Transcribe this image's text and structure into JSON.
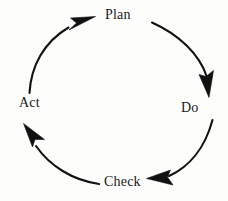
{
  "diagram": {
    "type": "cycle",
    "direction": "clockwise",
    "background_color": "#fdfdfc",
    "stroke_color": "#111111",
    "text_color": "#1a1a1a",
    "center": {
      "x": 114,
      "y": 100
    },
    "radius": 88,
    "nodes": [
      {
        "id": "plan",
        "label": "Plan",
        "position": "top",
        "x": 120,
        "y": 14,
        "angle_deg": 270
      },
      {
        "id": "do",
        "label": "Do",
        "position": "right",
        "x": 191,
        "y": 107,
        "angle_deg": 0
      },
      {
        "id": "check",
        "label": "Check",
        "position": "bottom",
        "x": 122,
        "y": 181,
        "angle_deg": 90
      },
      {
        "id": "act",
        "label": "Act",
        "position": "left",
        "x": 32,
        "y": 102,
        "angle_deg": 180
      }
    ],
    "arrows": [
      {
        "id": "arrow-plan-to-do",
        "from": "plan",
        "to": "do",
        "points_to": "Do",
        "arrowhead": "down"
      },
      {
        "id": "arrow-do-to-check",
        "from": "do",
        "to": "check",
        "points_to": "Check",
        "arrowhead": "left"
      },
      {
        "id": "arrow-check-to-act",
        "from": "check",
        "to": "act",
        "points_to": "Act",
        "arrowhead": "up-left"
      },
      {
        "id": "arrow-act-to-plan",
        "from": "act",
        "to": "plan",
        "points_to": "Plan",
        "arrowhead": "up-right"
      }
    ]
  }
}
